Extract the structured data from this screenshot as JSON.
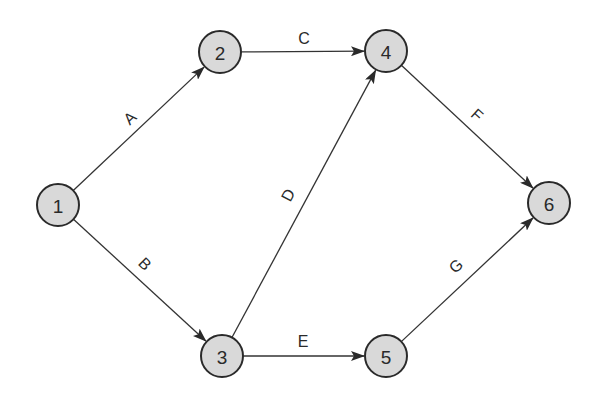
{
  "diagram": {
    "type": "activity-on-arrow network",
    "node_radius": 21,
    "colors": {
      "node_fill": "#d9d9d9",
      "node_stroke": "#2a2a2a",
      "edge": "#333333",
      "text": "#2a2a2a"
    },
    "nodes": [
      {
        "id": "1",
        "label": "1",
        "x": 58,
        "y": 205
      },
      {
        "id": "2",
        "label": "2",
        "x": 220,
        "y": 52
      },
      {
        "id": "3",
        "label": "3",
        "x": 222,
        "y": 356
      },
      {
        "id": "4",
        "label": "4",
        "x": 386,
        "y": 51
      },
      {
        "id": "5",
        "label": "5",
        "x": 386,
        "y": 356
      },
      {
        "id": "6",
        "label": "6",
        "x": 549,
        "y": 203
      }
    ],
    "edges": [
      {
        "id": "A",
        "label": "A",
        "from": "1",
        "to": "2",
        "lx": 130,
        "ly": 118,
        "rot": -43
      },
      {
        "id": "B",
        "label": "B",
        "from": "1",
        "to": "3",
        "lx": 145,
        "ly": 264,
        "rot": 45
      },
      {
        "id": "C",
        "label": "C",
        "from": "2",
        "to": "4",
        "lx": 304,
        "ly": 38,
        "rot": 0
      },
      {
        "id": "D",
        "label": "D",
        "from": "3",
        "to": "4",
        "lx": 288,
        "ly": 195,
        "rot": -62
      },
      {
        "id": "E",
        "label": "E",
        "from": "3",
        "to": "5",
        "lx": 303,
        "ly": 341,
        "rot": 0
      },
      {
        "id": "F",
        "label": "F",
        "from": "4",
        "to": "6",
        "lx": 477,
        "ly": 115,
        "rot": 42
      },
      {
        "id": "G",
        "label": "G",
        "from": "5",
        "to": "6",
        "lx": 456,
        "ly": 266,
        "rot": -42
      }
    ]
  }
}
